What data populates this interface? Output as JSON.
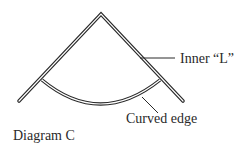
{
  "diagram": {
    "title": "Diagram C",
    "labels": {
      "inner_l": "Inner “L”",
      "curved_edge": "Curved edge"
    },
    "colors": {
      "stroke": "#2a2a2a",
      "fill": "#ffffff",
      "text": "#2a2a2a"
    },
    "shapes": {
      "inner_l": {
        "apex": [
          101,
          15
        ],
        "left_end": [
          20,
          102
        ],
        "right_end": [
          184,
          102
        ]
      },
      "curved_edge": {
        "start": [
          42,
          80
        ],
        "end": [
          160,
          80
        ],
        "control": [
          100,
          128
        ]
      }
    }
  }
}
